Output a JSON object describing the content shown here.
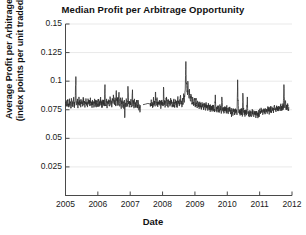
{
  "chart_data": {
    "type": "line",
    "title": "Median Profit per Arbitrage Opportunity",
    "xlabel": "Date",
    "ylabel_line1": "Average Profit per Arbitrage",
    "ylabel_line2": "(index points per unit traded)",
    "xlim": [
      2005.0,
      2012.0
    ],
    "ylim": [
      0.0,
      0.15
    ],
    "grid": true,
    "grid_axis": "y",
    "legend": null,
    "line_color": "#2f2f2f",
    "background": "#ffffff",
    "axis_color": "#4a4a4a",
    "yticks": [
      0,
      0.025,
      0.05,
      0.075,
      0.1,
      0.125,
      0.15
    ],
    "ytick_labels": [
      "",
      "0.025",
      "0.05",
      "0.075",
      "0.1",
      "0.125",
      "0.15"
    ],
    "xticks": [
      2005,
      2006,
      2007,
      2008,
      2009,
      2010,
      2011,
      2012
    ],
    "xtick_labels": [
      "2005",
      "2006",
      "2007",
      "2008",
      "2009",
      "2010",
      "2011",
      "2012"
    ],
    "series_name": "Median profit per arbitrage opportunity",
    "data_gap": [
      2007.32,
      2007.62
    ],
    "x": [
      2005.0,
      2005.02,
      2005.03,
      2005.05,
      2005.07,
      2005.08,
      2005.1,
      2005.12,
      2005.13,
      2005.15,
      2005.17,
      2005.18,
      2005.2,
      2005.22,
      2005.23,
      2005.25,
      2005.27,
      2005.28,
      2005.3,
      2005.32,
      2005.33,
      2005.35,
      2005.37,
      2005.38,
      2005.4,
      2005.42,
      2005.43,
      2005.45,
      2005.47,
      2005.48,
      2005.5,
      2005.52,
      2005.53,
      2005.55,
      2005.57,
      2005.58,
      2005.6,
      2005.62,
      2005.63,
      2005.65,
      2005.67,
      2005.68,
      2005.7,
      2005.72,
      2005.73,
      2005.75,
      2005.77,
      2005.78,
      2005.8,
      2005.82,
      2005.83,
      2005.85,
      2005.87,
      2005.88,
      2005.9,
      2005.92,
      2005.93,
      2005.95,
      2005.97,
      2005.98,
      2006.0,
      2006.02,
      2006.03,
      2006.05,
      2006.07,
      2006.08,
      2006.1,
      2006.12,
      2006.13,
      2006.15,
      2006.17,
      2006.18,
      2006.2,
      2006.22,
      2006.23,
      2006.25,
      2006.27,
      2006.28,
      2006.3,
      2006.32,
      2006.33,
      2006.35,
      2006.37,
      2006.38,
      2006.4,
      2006.42,
      2006.43,
      2006.45,
      2006.47,
      2006.48,
      2006.5,
      2006.52,
      2006.53,
      2006.55,
      2006.57,
      2006.58,
      2006.6,
      2006.62,
      2006.63,
      2006.65,
      2006.67,
      2006.68,
      2006.7,
      2006.72,
      2006.73,
      2006.75,
      2006.77,
      2006.78,
      2006.8,
      2006.82,
      2006.83,
      2006.85,
      2006.87,
      2006.88,
      2006.9,
      2006.92,
      2006.93,
      2006.95,
      2006.97,
      2006.98,
      2007.0,
      2007.02,
      2007.03,
      2007.05,
      2007.07,
      2007.08,
      2007.1,
      2007.12,
      2007.13,
      2007.15,
      2007.17,
      2007.18,
      2007.2,
      2007.22,
      2007.23,
      2007.25,
      2007.27,
      2007.28,
      2007.3,
      2007.32,
      2007.62,
      2007.63,
      2007.65,
      2007.67,
      2007.68,
      2007.7,
      2007.72,
      2007.73,
      2007.75,
      2007.77,
      2007.78,
      2007.8,
      2007.82,
      2007.83,
      2007.85,
      2007.87,
      2007.88,
      2007.9,
      2007.92,
      2007.93,
      2007.95,
      2007.97,
      2007.98,
      2008.0,
      2008.02,
      2008.03,
      2008.05,
      2008.07,
      2008.08,
      2008.1,
      2008.12,
      2008.13,
      2008.15,
      2008.17,
      2008.18,
      2008.2,
      2008.22,
      2008.23,
      2008.25,
      2008.27,
      2008.28,
      2008.3,
      2008.32,
      2008.33,
      2008.35,
      2008.37,
      2008.38,
      2008.4,
      2008.42,
      2008.43,
      2008.45,
      2008.47,
      2008.48,
      2008.5,
      2008.52,
      2008.53,
      2008.55,
      2008.57,
      2008.58,
      2008.6,
      2008.62,
      2008.63,
      2008.65,
      2008.67,
      2008.68,
      2008.7,
      2008.72,
      2008.73,
      2008.75,
      2008.77,
      2008.78,
      2008.8,
      2008.82,
      2008.83,
      2008.85,
      2008.87,
      2008.88,
      2008.9,
      2008.92,
      2008.93,
      2008.95,
      2008.97,
      2008.98,
      2009.0,
      2009.02,
      2009.03,
      2009.05,
      2009.07,
      2009.08,
      2009.1,
      2009.12,
      2009.13,
      2009.15,
      2009.17,
      2009.18,
      2009.2,
      2009.22,
      2009.23,
      2009.25,
      2009.27,
      2009.28,
      2009.3,
      2009.32,
      2009.33,
      2009.35,
      2009.37,
      2009.38,
      2009.4,
      2009.42,
      2009.43,
      2009.45,
      2009.47,
      2009.48,
      2009.5,
      2009.52,
      2009.53,
      2009.55,
      2009.57,
      2009.58,
      2009.6,
      2009.62,
      2009.63,
      2009.65,
      2009.67,
      2009.68,
      2009.7,
      2009.72,
      2009.73,
      2009.75,
      2009.77,
      2009.78,
      2009.8,
      2009.82,
      2009.83,
      2009.85,
      2009.87,
      2009.88,
      2009.9,
      2009.92,
      2009.93,
      2009.95,
      2009.97,
      2009.98,
      2010.0,
      2010.02,
      2010.03,
      2010.05,
      2010.07,
      2010.08,
      2010.1,
      2010.12,
      2010.13,
      2010.15,
      2010.17,
      2010.18,
      2010.2,
      2010.22,
      2010.23,
      2010.25,
      2010.27,
      2010.28,
      2010.3,
      2010.32,
      2010.33,
      2010.35,
      2010.37,
      2010.38,
      2010.4,
      2010.42,
      2010.43,
      2010.45,
      2010.47,
      2010.48,
      2010.5,
      2010.52,
      2010.53,
      2010.55,
      2010.57,
      2010.58,
      2010.6,
      2010.62,
      2010.63,
      2010.65,
      2010.67,
      2010.68,
      2010.7,
      2010.72,
      2010.73,
      2010.75,
      2010.77,
      2010.78,
      2010.8,
      2010.82,
      2010.83,
      2010.85,
      2010.87,
      2010.88,
      2010.9,
      2010.92,
      2010.93,
      2010.95,
      2010.97,
      2010.98,
      2011.0,
      2011.02,
      2011.03,
      2011.05,
      2011.07,
      2011.08,
      2011.1,
      2011.12,
      2011.13,
      2011.15,
      2011.17,
      2011.18,
      2011.2,
      2011.22,
      2011.23,
      2011.25,
      2011.27,
      2011.28,
      2011.3,
      2011.32,
      2011.33,
      2011.35,
      2011.37,
      2011.38,
      2011.4,
      2011.42,
      2011.43,
      2011.45,
      2011.47,
      2011.48,
      2011.5,
      2011.52,
      2011.53,
      2011.55,
      2011.57,
      2011.58,
      2011.6,
      2011.62,
      2011.63,
      2011.65,
      2011.67,
      2011.68,
      2011.7,
      2011.72,
      2011.73,
      2011.75,
      2011.77,
      2011.78,
      2011.8,
      2011.82,
      2011.83,
      2011.85,
      2011.87,
      2011.88,
      2011.9
    ],
    "y": [
      0.081,
      0.0795,
      0.0828,
      0.0782,
      0.0841,
      0.08,
      0.0772,
      0.0836,
      0.079,
      0.0812,
      0.0768,
      0.0848,
      0.0795,
      0.0822,
      0.0775,
      0.086,
      0.08,
      0.0785,
      0.0833,
      0.104,
      0.082,
      0.079,
      0.0845,
      0.0775,
      0.0808,
      0.0852,
      0.0788,
      0.082,
      0.0772,
      0.0838,
      0.08,
      0.0815,
      0.078,
      0.086,
      0.0795,
      0.0825,
      0.077,
      0.0812,
      0.0848,
      0.0788,
      0.082,
      0.0775,
      0.084,
      0.0798,
      0.083,
      0.0782,
      0.0855,
      0.0792,
      0.0818,
      0.0768,
      0.0835,
      0.08,
      0.0822,
      0.0778,
      0.0845,
      0.079,
      0.0815,
      0.0772,
      0.0828,
      0.0805,
      0.0798,
      0.084,
      0.0775,
      0.082,
      0.0788,
      0.0852,
      0.0795,
      0.0818,
      0.077,
      0.0835,
      0.08,
      0.0825,
      0.0782,
      0.097,
      0.081,
      0.079,
      0.0845,
      0.0775,
      0.0822,
      0.08,
      0.0838,
      0.0785,
      0.0815,
      0.0862,
      0.0795,
      0.0828,
      0.0772,
      0.084,
      0.0805,
      0.088,
      0.082,
      0.0795,
      0.085,
      0.0782,
      0.0918,
      0.083,
      0.08,
      0.086,
      0.0788,
      0.09,
      0.0825,
      0.0795,
      0.0855,
      0.077,
      0.082,
      0.0845,
      0.0788,
      0.0812,
      0.076,
      0.0835,
      0.068,
      0.08,
      0.079,
      0.0845,
      0.0775,
      0.0818,
      0.0955,
      0.08,
      0.0785,
      0.0822,
      0.0795,
      0.0838,
      0.0772,
      0.081,
      0.0925,
      0.0798,
      0.0828,
      0.0775,
      0.0845,
      0.079,
      0.0815,
      0.0768,
      0.0832,
      0.08,
      0.078,
      0.0822,
      0.0745,
      0.0795,
      0.0728,
      0.079,
      0.08,
      0.0782,
      0.0838,
      0.0795,
      0.0815,
      0.0772,
      0.086,
      0.0798,
      0.0825,
      0.078,
      0.0905,
      0.0812,
      0.079,
      0.0845,
      0.0775,
      0.082,
      0.0798,
      0.0835,
      0.0788,
      0.0815,
      0.077,
      0.0828,
      0.08,
      0.0818,
      0.0782,
      0.0948,
      0.0805,
      0.083,
      0.0775,
      0.0812,
      0.0862,
      0.0795,
      0.0822,
      0.077,
      0.084,
      0.0798,
      0.0815,
      0.0782,
      0.0852,
      0.0805,
      0.0828,
      0.0775,
      0.0818,
      0.079,
      0.0845,
      0.0772,
      0.081,
      0.0838,
      0.0795,
      0.082,
      0.0768,
      0.0855,
      0.08,
      0.0825,
      0.0782,
      0.0812,
      0.087,
      0.0798,
      0.0828,
      0.0775,
      0.0842,
      0.0805,
      0.089,
      0.082,
      0.086,
      0.0918,
      0.1172,
      0.099,
      0.0935,
      0.088,
      0.1,
      0.0905,
      0.085,
      0.093,
      0.087,
      0.0825,
      0.0885,
      0.084,
      0.08,
      0.0858,
      0.0818,
      0.079,
      0.0845,
      0.0812,
      0.0782,
      0.0838,
      0.0795,
      0.0765,
      0.0828,
      0.079,
      0.0812,
      0.0758,
      0.082,
      0.0785,
      0.0805,
      0.0752,
      0.0815,
      0.0778,
      0.08,
      0.0748,
      0.081,
      0.0772,
      0.0795,
      0.0745,
      0.0805,
      0.0768,
      0.079,
      0.0742,
      0.08,
      0.0762,
      0.0788,
      0.0738,
      0.0795,
      0.0758,
      0.0782,
      0.0735,
      0.0792,
      0.0755,
      0.0778,
      0.073,
      0.0788,
      0.088,
      0.0752,
      0.0775,
      0.0728,
      0.0785,
      0.0748,
      0.0772,
      0.0725,
      0.0782,
      0.0745,
      0.0768,
      0.0722,
      0.0862,
      0.0778,
      0.0742,
      0.0765,
      0.072,
      0.0775,
      0.074,
      0.0762,
      0.0718,
      0.0772,
      0.0738,
      0.0758,
      0.0715,
      0.0768,
      0.0735,
      0.0755,
      0.0712,
      0.0765,
      0.0688,
      0.0752,
      0.071,
      0.0762,
      0.073,
      0.075,
      0.0708,
      0.076,
      0.0728,
      0.0748,
      0.0705,
      0.1012,
      0.083,
      0.0758,
      0.0725,
      0.0745,
      0.0702,
      0.0755,
      0.0722,
      0.0742,
      0.07,
      0.0895,
      0.0752,
      0.072,
      0.074,
      0.0698,
      0.075,
      0.0718,
      0.0738,
      0.0862,
      0.0748,
      0.0715,
      0.0735,
      0.0695,
      0.0745,
      0.0712,
      0.0732,
      0.0692,
      0.0742,
      0.071,
      0.073,
      0.069,
      0.074,
      0.0708,
      0.0728,
      0.0688,
      0.0738,
      0.0705,
      0.0725,
      0.0685,
      0.0735,
      0.0702,
      0.0745,
      0.0718,
      0.0738,
      0.0762,
      0.0728,
      0.0748,
      0.0712,
      0.0755,
      0.0732,
      0.0752,
      0.0718,
      0.076,
      0.0735,
      0.0755,
      0.0722,
      0.0765,
      0.0738,
      0.0758,
      0.0725,
      0.0768,
      0.0742,
      0.0762,
      0.0728,
      0.0772,
      0.0745,
      0.0765,
      0.073,
      0.0775,
      0.0748,
      0.0768,
      0.0735,
      0.0778,
      0.0752,
      0.0772,
      0.0738,
      0.0782,
      0.0755,
      0.0775,
      0.0742,
      0.0785,
      0.0758,
      0.0778,
      0.0745,
      0.0788,
      0.0762,
      0.097,
      0.08,
      0.0772,
      0.083,
      0.075,
      0.0792,
      0.0765,
      0.0785,
      0.0742,
      0.0775,
      0.0755,
      0.0738,
      0.0748,
      0.0728,
      0.0735,
      0.0742,
      0.0722,
      0.0732,
      0.0718,
      0.0728,
      0.074,
      0.0715,
      0.0725,
      0.0735,
      0.0712,
      0.0722,
      0.0732,
      0.071,
      0.072,
      0.073,
      0.0708,
      0.0718,
      0.0728,
      0.0705,
      0.0715,
      0.0725,
      0.0702,
      0.0712,
      0.0722,
      0.07,
      0.071,
      0.072,
      0.0698,
      0.0708,
      0.0718,
      0.0696,
      0.0706,
      0.0716,
      0.0694,
      0.0704,
      0.0714,
      0.0692,
      0.0702,
      0.0712,
      0.069,
      0.07,
      0.071,
      0.0688,
      0.0698,
      0.0708,
      0.0686,
      0.0696,
      0.0706,
      0.0684,
      0.0694,
      0.0704,
      0.073,
      0.07,
      0.0688,
      0.0725
    ]
  }
}
